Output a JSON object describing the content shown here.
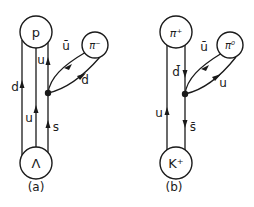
{
  "diagrams": [
    {
      "id": "a",
      "caption": "(a)",
      "top_particle": "p",
      "bottom_particle": "Λ",
      "emitted_particle": "π⁻",
      "quark_lines": [
        {
          "label": "d",
          "direction": "up"
        },
        {
          "label": "u",
          "direction": "up"
        },
        {
          "label": "s",
          "direction": "up",
          "segment": "lower"
        },
        {
          "label": "u",
          "direction": "up",
          "segment": "upper"
        }
      ],
      "loop_lines": [
        {
          "label": "ū",
          "direction": "toward-vertex"
        },
        {
          "label": "d",
          "direction": "toward-meson"
        }
      ]
    },
    {
      "id": "b",
      "caption": "(b)",
      "top_particle": "π⁺",
      "bottom_particle": "K⁺",
      "emitted_particle": "π⁰",
      "quark_lines": [
        {
          "label": "u",
          "direction": "up"
        },
        {
          "label": "d̄",
          "direction": "down",
          "segment": "upper"
        },
        {
          "label": "s̄",
          "direction": "down",
          "segment": "lower"
        }
      ],
      "loop_lines": [
        {
          "label": "ū",
          "direction": "toward-vertex"
        },
        {
          "label": "u",
          "direction": "toward-meson"
        }
      ]
    }
  ],
  "labels": {
    "a_top": "p",
    "a_bottom": "Λ",
    "a_meson": "π⁻",
    "a_left_d": "d",
    "a_mid_u": "u",
    "a_right_upper_u": "u",
    "a_right_lower_s": "s",
    "a_loop_ubar": "ū",
    "a_loop_d": "d",
    "a_caption": "(a)",
    "b_top": "π⁺",
    "b_bottom": "K⁺",
    "b_meson": "π⁰",
    "b_left_u": "u",
    "b_right_upper_dbar": "d̄",
    "b_right_lower_sbar": "s̄",
    "b_loop_ubar": "ū",
    "b_loop_u": "u",
    "b_caption": "(b)"
  }
}
